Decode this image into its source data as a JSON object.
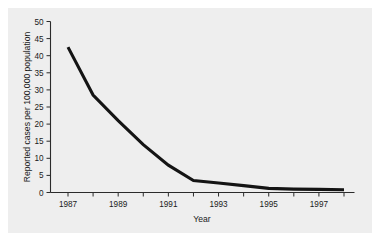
{
  "chart_data": {
    "type": "line",
    "title": "",
    "xlabel": "Year",
    "ylabel": "Reported cases per 100,000 population",
    "x": [
      1987,
      1988,
      1989,
      1990,
      1991,
      1992,
      1993,
      1994,
      1995,
      1996,
      1997,
      1998
    ],
    "values": [
      42.5,
      28.5,
      21.0,
      14.0,
      8.0,
      3.5,
      2.8,
      2.0,
      1.2,
      1.0,
      0.9,
      0.8
    ],
    "series": [
      {
        "name": "Reported cases per 100,000 population",
        "values": [
          42.5,
          28.5,
          21.0,
          14.0,
          8.0,
          3.5,
          2.8,
          2.0,
          1.2,
          1.0,
          0.9,
          0.8
        ]
      }
    ],
    "xlim": [
      1987,
      1998
    ],
    "ylim": [
      0,
      50
    ],
    "ytick_labels": [
      "0",
      "5",
      "10",
      "15",
      "20",
      "25",
      "30",
      "35",
      "40",
      "45",
      "50"
    ],
    "ytick_values": [
      0,
      5,
      10,
      15,
      20,
      25,
      30,
      35,
      40,
      45,
      50
    ],
    "xtick_values": [
      1987,
      1988,
      1989,
      1990,
      1991,
      1992,
      1993,
      1994,
      1995,
      1996,
      1997,
      1998
    ],
    "xtick_labels": [
      "1987",
      "",
      "1989",
      "",
      "1991",
      "",
      "1993",
      "",
      "1995",
      "",
      "1997",
      ""
    ],
    "grid": false,
    "legend": "none",
    "line_color": "#141414",
    "panel_color": "#eeeeee",
    "axis_color": "#2b2b2b"
  }
}
